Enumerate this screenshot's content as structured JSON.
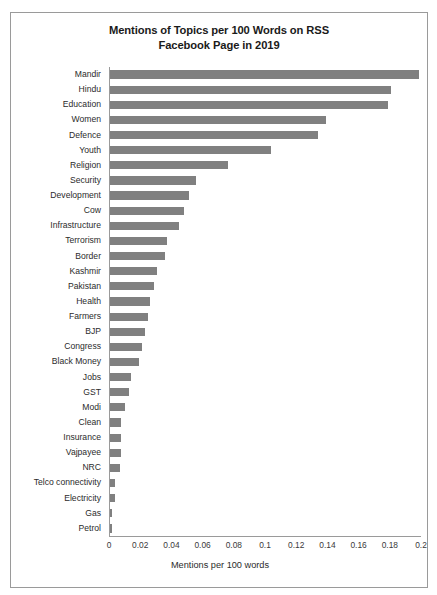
{
  "scan_artifact": {
    "text": ""
  },
  "chart": {
    "title_line1": "Mentions of Topics per 100 Words on RSS",
    "title_line2": "Facebook Page in 2019",
    "x_axis_title": "Mentions per 100 words",
    "bar_color": "#808080",
    "frame_color": "#9a9a9a",
    "text_color": "#2b2b2b"
  },
  "chart_data": {
    "type": "bar",
    "orientation": "horizontal",
    "title": "Mentions of Topics per 100 Words on RSS Facebook Page in 2019",
    "xlabel": "Mentions per 100 words",
    "ylabel": "",
    "xlim": [
      0,
      0.2
    ],
    "xticks": [
      0,
      0.02,
      0.04,
      0.06,
      0.08,
      0.1,
      0.12,
      0.14,
      0.16,
      0.18,
      0.2
    ],
    "xticklabels": [
      "0",
      "0.02",
      "0.04",
      "0.06",
      "0.08",
      "0.1",
      "0.12",
      "0.14",
      "0.16",
      "0.18",
      "0.2"
    ],
    "grid": false,
    "legend": false,
    "categories": [
      "Mandir",
      "Hindu",
      "Education",
      "Women",
      "Defence",
      "Youth",
      "Religion",
      "Security",
      "Development",
      "Cow",
      "Infrastructure",
      "Terrorism",
      "Border",
      "Kashmir",
      "Pakistan",
      "Health",
      "Farmers",
      "BJP",
      "Congress",
      "Black Money",
      "Jobs",
      "GST",
      "Modi",
      "Clean",
      "Insurance",
      "Vajpayee",
      "NRC",
      "Telco connectivity",
      "Electricity",
      "Gas",
      "Petrol"
    ],
    "values": [
      0.199,
      0.181,
      0.179,
      0.139,
      0.134,
      0.104,
      0.076,
      0.056,
      0.051,
      0.048,
      0.045,
      0.037,
      0.036,
      0.031,
      0.029,
      0.026,
      0.025,
      0.023,
      0.021,
      0.019,
      0.014,
      0.013,
      0.01,
      0.008,
      0.008,
      0.008,
      0.007,
      0.004,
      0.004,
      0.002,
      0.002
    ]
  }
}
